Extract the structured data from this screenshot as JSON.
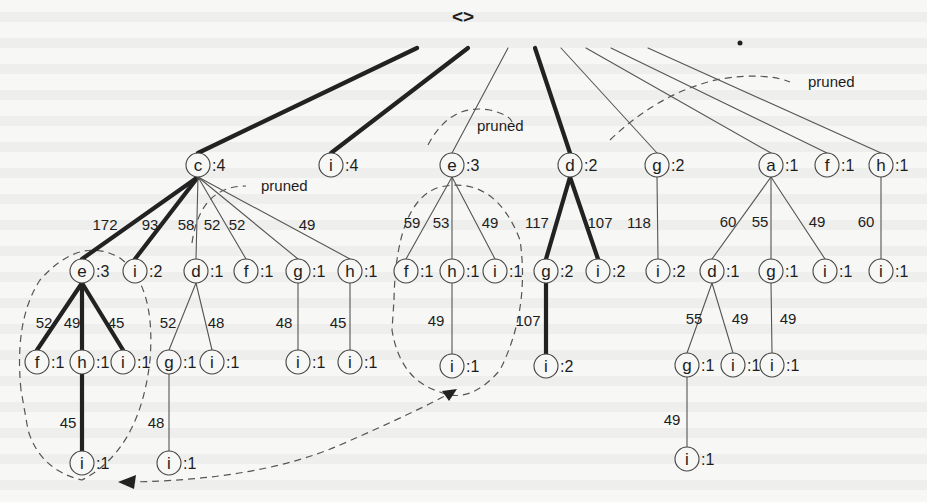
{
  "diagram": {
    "type": "prefix-tree",
    "root": {
      "label": "<>",
      "x": 463,
      "y": 16
    },
    "annotations": [
      {
        "id": "pruned-1",
        "text": "pruned",
        "x": 808,
        "y": 87
      },
      {
        "id": "pruned-2",
        "text": "pruned",
        "x": 477,
        "y": 131
      },
      {
        "id": "pruned-3",
        "text": "pruned",
        "x": 261,
        "y": 191
      }
    ],
    "nodes": [
      {
        "id": "n-c",
        "letter": "c",
        "count": ":4",
        "x": 198,
        "y": 165
      },
      {
        "id": "n-i4",
        "letter": "i",
        "count": ":4",
        "x": 331,
        "y": 165
      },
      {
        "id": "n-e3",
        "letter": "e",
        "count": ":3",
        "x": 452,
        "y": 165
      },
      {
        "id": "n-d2",
        "letter": "d",
        "count": ":2",
        "x": 570,
        "y": 165
      },
      {
        "id": "n-g2",
        "letter": "g",
        "count": ":2",
        "x": 657,
        "y": 165
      },
      {
        "id": "n-a1",
        "letter": "a",
        "count": ":1",
        "x": 771,
        "y": 165
      },
      {
        "id": "n-f1t",
        "letter": "f",
        "count": ":1",
        "x": 827,
        "y": 165
      },
      {
        "id": "n-h1t",
        "letter": "h",
        "count": ":1",
        "x": 881,
        "y": 165
      },
      {
        "id": "n-ce",
        "letter": "e",
        "count": ":3",
        "x": 82,
        "y": 271
      },
      {
        "id": "n-ci",
        "letter": "i",
        "count": ":2",
        "x": 135,
        "y": 271
      },
      {
        "id": "n-cd",
        "letter": "d",
        "count": ":1",
        "x": 196,
        "y": 271
      },
      {
        "id": "n-cf",
        "letter": "f",
        "count": ":1",
        "x": 246,
        "y": 271
      },
      {
        "id": "n-cg",
        "letter": "g",
        "count": ":1",
        "x": 298,
        "y": 271
      },
      {
        "id": "n-ch",
        "letter": "h",
        "count": ":1",
        "x": 350,
        "y": 271
      },
      {
        "id": "n-ef",
        "letter": "f",
        "count": ":1",
        "x": 406,
        "y": 271
      },
      {
        "id": "n-eh",
        "letter": "h",
        "count": ":1",
        "x": 452,
        "y": 271
      },
      {
        "id": "n-ei",
        "letter": "i",
        "count": ":1",
        "x": 495,
        "y": 271
      },
      {
        "id": "n-dg",
        "letter": "g",
        "count": ":2",
        "x": 546,
        "y": 271
      },
      {
        "id": "n-di",
        "letter": "i",
        "count": ":2",
        "x": 598,
        "y": 271
      },
      {
        "id": "n-gi",
        "letter": "i",
        "count": ":2",
        "x": 658,
        "y": 271
      },
      {
        "id": "n-ad",
        "letter": "d",
        "count": ":1",
        "x": 712,
        "y": 271
      },
      {
        "id": "n-ag",
        "letter": "g",
        "count": ":1",
        "x": 771,
        "y": 271
      },
      {
        "id": "n-ai",
        "letter": "i",
        "count": ":1",
        "x": 825,
        "y": 271
      },
      {
        "id": "n-hi",
        "letter": "i",
        "count": ":1",
        "x": 881,
        "y": 271
      },
      {
        "id": "n-cef",
        "letter": "f",
        "count": ":1",
        "x": 37,
        "y": 362
      },
      {
        "id": "n-ceh",
        "letter": "h",
        "count": ":1",
        "x": 82,
        "y": 362
      },
      {
        "id": "n-cei",
        "letter": "i",
        "count": ":1",
        "x": 123,
        "y": 362
      },
      {
        "id": "n-cdg",
        "letter": "g",
        "count": ":1",
        "x": 169,
        "y": 362
      },
      {
        "id": "n-cdi",
        "letter": "i",
        "count": ":1",
        "x": 212,
        "y": 362
      },
      {
        "id": "n-cgi",
        "letter": "i",
        "count": ":1",
        "x": 298,
        "y": 362
      },
      {
        "id": "n-chi",
        "letter": "i",
        "count": ":1",
        "x": 350,
        "y": 362
      },
      {
        "id": "n-ehi",
        "letter": "i",
        "count": ":1",
        "x": 452,
        "y": 366
      },
      {
        "id": "n-dgi",
        "letter": "i",
        "count": ":2",
        "x": 546,
        "y": 366
      },
      {
        "id": "n-adg",
        "letter": "g",
        "count": ":1",
        "x": 687,
        "y": 365
      },
      {
        "id": "n-adi",
        "letter": "i",
        "count": ":1",
        "x": 733,
        "y": 365
      },
      {
        "id": "n-agi",
        "letter": "i",
        "count": ":1",
        "x": 772,
        "y": 365
      },
      {
        "id": "n-cehi",
        "letter": "i",
        "count": ":1",
        "x": 82,
        "y": 463
      },
      {
        "id": "n-cdgi",
        "letter": "i",
        "count": ":1",
        "x": 169,
        "y": 463
      },
      {
        "id": "n-adgi",
        "letter": "i",
        "count": ":1",
        "x": 687,
        "y": 459
      }
    ],
    "edges": [
      {
        "from": "root",
        "to": "n-c",
        "weight": "thick",
        "label": ""
      },
      {
        "from": "root",
        "to": "n-i4",
        "weight": "thick",
        "label": ""
      },
      {
        "from": "root",
        "to": "n-e3",
        "weight": "thin",
        "label": ""
      },
      {
        "from": "root",
        "to": "n-d2",
        "weight": "thick",
        "label": ""
      },
      {
        "from": "root",
        "to": "n-g2",
        "weight": "thin",
        "label": ""
      },
      {
        "from": "root",
        "to": "n-a1",
        "weight": "thin",
        "label": ""
      },
      {
        "from": "root",
        "to": "n-f1t",
        "weight": "thin",
        "label": ""
      },
      {
        "from": "root",
        "to": "n-h1t",
        "weight": "thin",
        "label": ""
      },
      {
        "from": "n-c",
        "to": "n-ce",
        "weight": "thick",
        "label": "172",
        "lx": 105,
        "ly": 224
      },
      {
        "from": "n-c",
        "to": "n-ci",
        "weight": "thick",
        "label": "93",
        "lx": 150,
        "ly": 224
      },
      {
        "from": "n-c",
        "to": "n-cd",
        "weight": "thin",
        "label": "58",
        "lx": 186,
        "ly": 224
      },
      {
        "from": "n-c",
        "to": "n-cf",
        "weight": "thin",
        "label": "52",
        "lx": 212,
        "ly": 224
      },
      {
        "from": "n-c",
        "to": "n-cg",
        "weight": "thin",
        "label": "52",
        "lx": 237,
        "ly": 224
      },
      {
        "from": "n-c",
        "to": "n-ch",
        "weight": "thin",
        "label": "49",
        "lx": 307,
        "ly": 224
      },
      {
        "from": "n-e3",
        "to": "n-ef",
        "weight": "thin",
        "label": "59",
        "lx": 412,
        "ly": 222
      },
      {
        "from": "n-e3",
        "to": "n-eh",
        "weight": "thin",
        "label": "53",
        "lx": 441,
        "ly": 222
      },
      {
        "from": "n-e3",
        "to": "n-ei",
        "weight": "thin",
        "label": "49",
        "lx": 490,
        "ly": 222
      },
      {
        "from": "n-d2",
        "to": "n-dg",
        "weight": "thick",
        "label": "117",
        "lx": 537,
        "ly": 222
      },
      {
        "from": "n-d2",
        "to": "n-di",
        "weight": "thick",
        "label": "107",
        "lx": 600,
        "ly": 222
      },
      {
        "from": "n-g2",
        "to": "n-gi",
        "weight": "thin",
        "label": "118",
        "lx": 639,
        "ly": 222
      },
      {
        "from": "n-a1",
        "to": "n-ad",
        "weight": "thin",
        "label": "60",
        "lx": 728,
        "ly": 221
      },
      {
        "from": "n-a1",
        "to": "n-ag",
        "weight": "thin",
        "label": "55",
        "lx": 760,
        "ly": 221
      },
      {
        "from": "n-a1",
        "to": "n-ai",
        "weight": "thin",
        "label": "49",
        "lx": 817,
        "ly": 221
      },
      {
        "from": "n-h1t",
        "to": "n-hi",
        "weight": "thin",
        "label": "60",
        "lx": 866,
        "ly": 221
      },
      {
        "from": "n-ce",
        "to": "n-cef",
        "weight": "thick",
        "label": "52",
        "lx": 44,
        "ly": 322
      },
      {
        "from": "n-ce",
        "to": "n-ceh",
        "weight": "thick",
        "label": "49",
        "lx": 72,
        "ly": 322
      },
      {
        "from": "n-ce",
        "to": "n-cei",
        "weight": "thick",
        "label": "45",
        "lx": 116,
        "ly": 322
      },
      {
        "from": "n-cd",
        "to": "n-cdg",
        "weight": "thin",
        "label": "52",
        "lx": 168,
        "ly": 322
      },
      {
        "from": "n-cd",
        "to": "n-cdi",
        "weight": "thin",
        "label": "48",
        "lx": 216,
        "ly": 322
      },
      {
        "from": "n-cg",
        "to": "n-cgi",
        "weight": "thin",
        "label": "48",
        "lx": 284,
        "ly": 322
      },
      {
        "from": "n-ch",
        "to": "n-chi",
        "weight": "thin",
        "label": "45",
        "lx": 338,
        "ly": 322
      },
      {
        "from": "n-eh",
        "to": "n-ehi",
        "weight": "thin",
        "label": "49",
        "lx": 436,
        "ly": 320
      },
      {
        "from": "n-dg",
        "to": "n-dgi",
        "weight": "thick",
        "label": "107",
        "lx": 528,
        "ly": 320
      },
      {
        "from": "n-ad",
        "to": "n-adg",
        "weight": "thin",
        "label": "55",
        "lx": 694,
        "ly": 318
      },
      {
        "from": "n-ad",
        "to": "n-adi",
        "weight": "thin",
        "label": "49",
        "lx": 740,
        "ly": 318
      },
      {
        "from": "n-ag",
        "to": "n-agi",
        "weight": "thin",
        "label": "49",
        "lx": 788,
        "ly": 318
      },
      {
        "from": "n-ceh",
        "to": "n-cehi",
        "weight": "thick",
        "label": "45",
        "lx": 68,
        "ly": 422
      },
      {
        "from": "n-cdg",
        "to": "n-cdgi",
        "weight": "thin",
        "label": "48",
        "lx": 156,
        "ly": 422
      },
      {
        "from": "n-adg",
        "to": "n-adgi",
        "weight": "thin",
        "label": "49",
        "lx": 672,
        "ly": 419
      }
    ],
    "dashed_regions": [
      {
        "id": "prune-arc-top-right",
        "desc": "dashed arc from g:2 region up toward pruned (top right)"
      },
      {
        "id": "prune-arc-e3",
        "desc": "dashed arc over e:3 near pruned"
      },
      {
        "id": "prune-arc-c",
        "desc": "short dashed arc under c:4 near pruned"
      },
      {
        "id": "loop-ce-subtree",
        "desc": "dashed loop enclosing e:3 subtree under c"
      },
      {
        "id": "loop-e3-subtree",
        "desc": "dashed loop enclosing e:3 subtree at root level"
      },
      {
        "id": "double-arrow",
        "desc": "dashed double-headed arrow linking the two loops"
      }
    ],
    "colors": {
      "background": "#f7f7f5",
      "ink": "#1d1d1d",
      "thin_edge": "#555555",
      "thick_edge": "#222222"
    }
  }
}
